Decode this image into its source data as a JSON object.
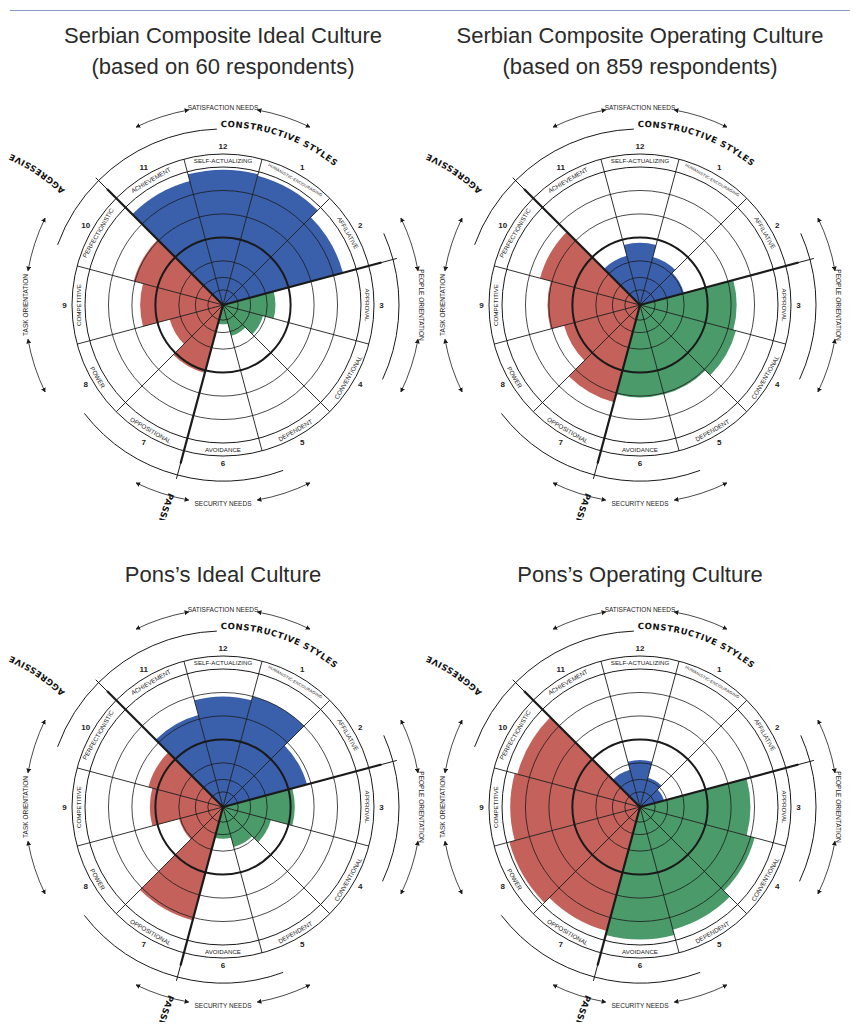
{
  "chart_data": [
    {
      "type": "circumplex",
      "title": "Serbian Composite Ideal Culture",
      "subtitle": "(based on 60 respondents)",
      "scale_note": "values are relative radii (0-100) of the filled wedge, 50 = bold middle ring",
      "sectors": [
        "Self-Actualizing",
        "Humanistic-Encouraging",
        "Affiliative",
        "Approval",
        "Conventional",
        "Dependent",
        "Avoidance",
        "Oppositional",
        "Power",
        "Competitive",
        "Perfectionistic",
        "Achievement"
      ],
      "numbers": [
        12,
        1,
        2,
        3,
        4,
        5,
        6,
        7,
        8,
        9,
        10,
        11
      ],
      "values": [
        98,
        97,
        90,
        38,
        30,
        23,
        14,
        51,
        40,
        60,
        67,
        93
      ]
    },
    {
      "type": "circumplex",
      "title": "Serbian Composite Operating Culture",
      "subtitle": "(based on 859 respondents)",
      "scale_note": "values are relative radii (0-100) of the filled wedge, 50 = bold middle ring",
      "sectors": [
        "Self-Actualizing",
        "Humanistic-Encouraging",
        "Affiliative",
        "Approval",
        "Conventional",
        "Dependent",
        "Avoidance",
        "Oppositional",
        "Power",
        "Competitive",
        "Perfectionistic",
        "Achievement"
      ],
      "numbers": [
        12,
        1,
        2,
        3,
        4,
        5,
        6,
        7,
        8,
        9,
        10,
        11
      ],
      "values": [
        45,
        36,
        33,
        70,
        72,
        67,
        67,
        73,
        57,
        67,
        75,
        37
      ]
    },
    {
      "type": "circumplex",
      "title": "Pons's Ideal Culture",
      "subtitle": "",
      "scale_note": "values are relative radii (0-100) of the filled wedge, 50 = bold middle ring",
      "sectors": [
        "Self-Actualizing",
        "Humanistic-Encouraging",
        "Affiliative",
        "Approval",
        "Conventional",
        "Dependent",
        "Avoidance",
        "Oppositional",
        "Power",
        "Competitive",
        "Perfectionistic",
        "Achievement"
      ],
      "numbers": [
        12,
        1,
        2,
        3,
        4,
        5,
        6,
        7,
        8,
        9,
        10,
        11
      ],
      "values": [
        80,
        83,
        63,
        52,
        36,
        30,
        23,
        85,
        33,
        53,
        56,
        69
      ]
    },
    {
      "type": "circumplex",
      "title": "Pons's Operating Culture",
      "subtitle": "",
      "scale_note": "values are relative radii (0-100) of the filled wedge, 50 = bold middle ring",
      "sectors": [
        "Self-Actualizing",
        "Humanistic-Encouraging",
        "Affiliative",
        "Approval",
        "Conventional",
        "Dependent",
        "Avoidance",
        "Oppositional",
        "Power",
        "Competitive",
        "Perfectionistic",
        "Achievement"
      ],
      "numbers": [
        12,
        1,
        2,
        3,
        4,
        5,
        6,
        7,
        8,
        9,
        10,
        11
      ],
      "values": [
        34,
        22,
        18,
        80,
        86,
        92,
        96,
        93,
        98,
        94,
        92,
        28
      ]
    }
  ],
  "labels": {
    "sectors_display": [
      "SELF-ACTUALIZING",
      "HUMANISTIC-ENCOURAGING",
      "AFFILIATIVE",
      "APPROVAL",
      "CONVENTIONAL",
      "DEPENDENT",
      "AVOIDANCE",
      "OPPOSITIONAL",
      "POWER",
      "COMPETITIVE",
      "PERFECTIONISTIC",
      "ACHIEVEMENT"
    ],
    "constructive": "CONSTRUCTIVE STYLES",
    "passive": "PASSIVE / DEFENSIVE STYLES",
    "aggressive": "AGGRESSIVE / DEFENSIVE STYLES",
    "satisfaction": "SATISFACTION NEEDS",
    "security": "SECURITY NEEDS",
    "people": "PEOPLE ORIENTATION",
    "task": "TASK ORIENTATION"
  },
  "colors": {
    "constructive": "#3a5fab",
    "passive": "#4b9a6a",
    "aggressive": "#c4615a",
    "line": "#1a1a1a",
    "rule": "#8a9bc4"
  },
  "panels": [
    {
      "title": "Serbian Composite Ideal Culture",
      "subtitle": "(based on 60 respondents)"
    },
    {
      "title": "Serbian Composite Operating Culture",
      "subtitle": "(based on 859 respondents)"
    },
    {
      "title": "Pons’s Ideal Culture",
      "subtitle": ""
    },
    {
      "title": "Pons’s Operating Culture",
      "subtitle": ""
    }
  ]
}
